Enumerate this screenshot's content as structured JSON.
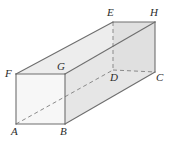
{
  "figure": {
    "name": "rectangular-prism-diagram",
    "type": "geometric-solid",
    "solid": "rectangular prism",
    "background_color": "#ffffff",
    "edge_color": "#6e6e6e",
    "hidden_edge_color": "#8a8a8a",
    "label_color": "#2b2b2b",
    "faces": {
      "front_color": "#f7f7f7",
      "top_color": "#ededed",
      "right_color": "#e4e4e4",
      "bottom_color": "#e9e9e9"
    },
    "vertices": [
      {
        "label": "A",
        "x": 16,
        "y": 124,
        "lx": 11,
        "ly": 129,
        "hidden": false
      },
      {
        "label": "B",
        "x": 65,
        "y": 124,
        "lx": 61,
        "ly": 129,
        "hidden": false
      },
      {
        "label": "C",
        "x": 155,
        "y": 72,
        "lx": 155,
        "ly": 74,
        "hidden": false
      },
      {
        "label": "D",
        "x": 113,
        "y": 70,
        "lx": 110,
        "ly": 73,
        "hidden": true
      },
      {
        "label": "E",
        "x": 113,
        "y": 22,
        "lx": 107,
        "ly": 6,
        "hidden": false
      },
      {
        "label": "F",
        "x": 16,
        "y": 74,
        "lx": 5,
        "ly": 67,
        "hidden": false
      },
      {
        "label": "G",
        "x": 65,
        "y": 74,
        "lx": 57,
        "ly": 60,
        "hidden": false
      },
      {
        "label": "H",
        "x": 155,
        "y": 22,
        "lx": 150,
        "ly": 6,
        "hidden": false
      }
    ],
    "solid_edges": [
      {
        "name": "edge-F-G",
        "from": "F",
        "to": "G"
      },
      {
        "name": "edge-G-B",
        "from": "G",
        "to": "B"
      },
      {
        "name": "edge-B-A",
        "from": "B",
        "to": "A"
      },
      {
        "name": "edge-A-F",
        "from": "A",
        "to": "F"
      },
      {
        "name": "edge-F-E",
        "from": "F",
        "to": "E"
      },
      {
        "name": "edge-G-H",
        "from": "G",
        "to": "H"
      },
      {
        "name": "edge-B-C",
        "from": "B",
        "to": "C"
      },
      {
        "name": "edge-E-H",
        "from": "E",
        "to": "H"
      },
      {
        "name": "edge-H-C",
        "from": "H",
        "to": "C"
      }
    ],
    "dashed_edges": [
      {
        "name": "edge-E-D",
        "from": "E",
        "to": "D"
      },
      {
        "name": "edge-D-C",
        "from": "D",
        "to": "C"
      },
      {
        "name": "edge-A-D",
        "from": "A",
        "to": "D"
      }
    ]
  }
}
